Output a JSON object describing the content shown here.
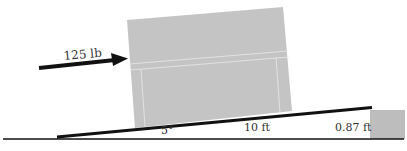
{
  "diagram": {
    "force_label": "125 lb",
    "angle_label": "5°",
    "ramp_length_label": "10 ft",
    "height_label": "0.87 ft",
    "colors": {
      "box_fill": "#c4c4c4",
      "block_fill": "#bdbdbd",
      "line": "#111111",
      "text": "#333333",
      "background": "#ffffff"
    }
  }
}
